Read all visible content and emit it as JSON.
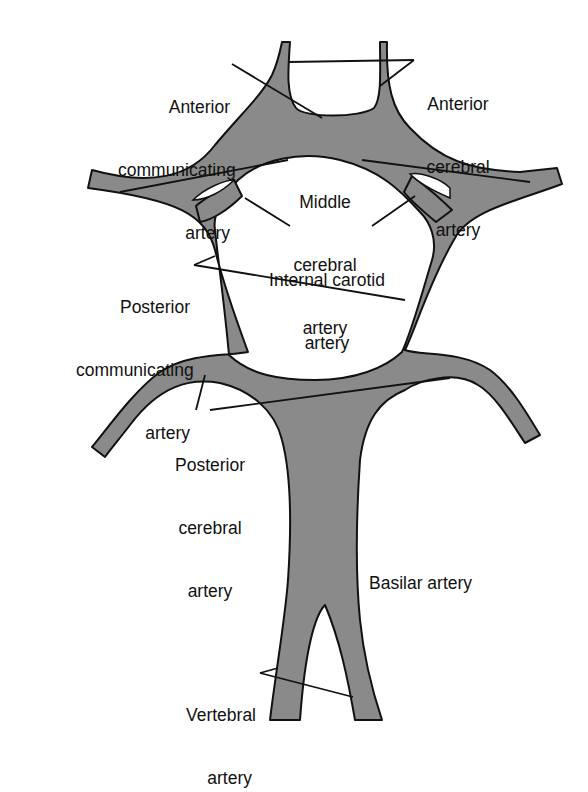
{
  "diagram": {
    "vessel_color": "#8a8a8a",
    "outline_color": "#111111",
    "background": "#ffffff",
    "labels": [
      {
        "id": "anterior-communicating-artery",
        "line1": "Anterior",
        "line2": "communicating",
        "line3": "artery"
      },
      {
        "id": "anterior-cerebral-artery",
        "line1": "Anterior",
        "line2": "cerebral",
        "line3": "artery"
      },
      {
        "id": "middle-cerebral-artery",
        "line1": "Middle",
        "line2": "cerebral",
        "line3": "artery"
      },
      {
        "id": "internal-carotid-artery",
        "line1": "Internal carotid",
        "line2": "artery"
      },
      {
        "id": "posterior-communicating-artery",
        "line1": "Posterior",
        "line2": "communicating",
        "line3": "artery"
      },
      {
        "id": "posterior-cerebral-artery",
        "line1": "Posterior",
        "line2": "cerebral",
        "line3": "artery"
      },
      {
        "id": "basilar-artery",
        "line1": "Basilar artery"
      },
      {
        "id": "vertebral-artery",
        "line1": "Vertebral",
        "line2": "artery"
      }
    ]
  }
}
